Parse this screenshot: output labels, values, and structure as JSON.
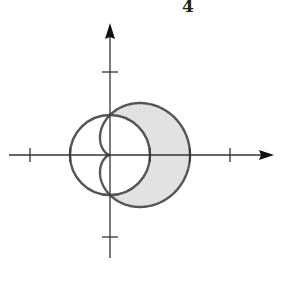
{
  "page": {
    "number": "4"
  },
  "figure": {
    "origin_px": [
      110,
      155
    ],
    "unit_px": 40,
    "curves": [
      {
        "name": "circle",
        "equation": "r = 1"
      },
      {
        "name": "cardioid",
        "equation": "r = 1 + cos(theta)"
      }
    ],
    "shaded_region": "inside r = 1 + cos(theta), outside r = 1",
    "x_ticks": [
      -2,
      -1,
      1,
      2,
      3
    ],
    "y_ticks": [
      -2,
      2
    ],
    "colors": {
      "stroke": "#555555",
      "axis": "#333333",
      "fill": "#e2e2e2"
    }
  }
}
